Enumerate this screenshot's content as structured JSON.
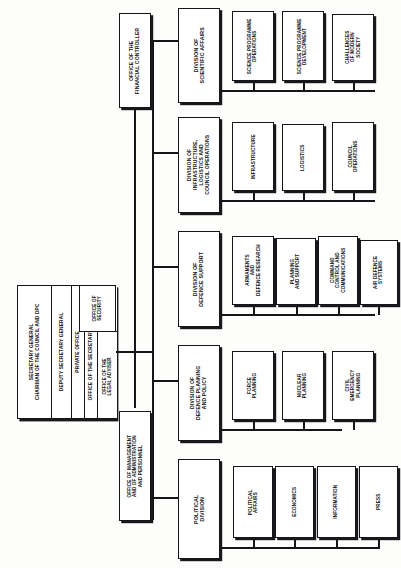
{
  "chart": {
    "type": "organization-chart",
    "orientation": "rotated-90-ccw",
    "top": {
      "label": "SECRETARY GENERAL\nCHAIRMAN OF THE COUNCIL AND DPC"
    },
    "executive_stack": [
      {
        "id": "secretary-general",
        "label": "SECRETARY GENERAL\nCHAIRMAN OF THE COUNCIL AND DPC"
      },
      {
        "id": "deputy-secretary-general",
        "label": "DEPUTY SECRETARY GENERAL"
      },
      {
        "id": "private-office",
        "label": "PRIVATE OFFICE"
      },
      {
        "id": "office-of-the-secretary-general",
        "label": "OFFICE OF THE SECRETARY GENERAL"
      },
      {
        "id": "executive-secretariat",
        "label": "EXECUTIVE\nSECRETARIAT"
      },
      {
        "id": "office-of-the-legal-adviser",
        "label": "OFFICE OF THE\nLEGAL ADVISER"
      },
      {
        "id": "office-of-security",
        "label": "OFFICE OF\nSECURITY"
      }
    ],
    "staff_offices": [
      {
        "id": "office-of-the-financial-controller",
        "label": "OFFICE OF THE\nFINANCIAL CONTROLLER"
      },
      {
        "id": "office-of-management-and-of-administration-and-personnel",
        "label": "OFFICE OF MANAGEMENT\nAND OF ADMINISTRATION\nAND PERSONNEL"
      }
    ],
    "divisions": [
      {
        "id": "division-of-scientific-affairs",
        "label": "DIVISION OF\nSCIENTIFIC AFFAIRS",
        "units": [
          {
            "id": "science-programme-operations",
            "label": "SCIENCE PROGRAMME\nOPERATIONS"
          },
          {
            "id": "science-programme-development",
            "label": "SCIENCE PROGRAMME\nDEVELOPMENT"
          },
          {
            "id": "challenges-of-modern-society",
            "label": "CHALLENGES\nOF MODERN\nSOCIETY"
          }
        ]
      },
      {
        "id": "division-of-infrastructure-logistics-and-council-operations",
        "label": "DIVISION OF\nINFRASTRUCTURE,\nLOGISTICS AND\nCOUNCIL OPERATIONS",
        "units": [
          {
            "id": "infrastructure",
            "label": "INFRASTRUCTURE"
          },
          {
            "id": "logistics",
            "label": "LOGISTICS"
          },
          {
            "id": "council-operations",
            "label": "COUNCIL\nOPERATIONS"
          }
        ]
      },
      {
        "id": "division-of-defence-support",
        "label": "DIVISION OF\nDEFENCE SUPPORT",
        "units": [
          {
            "id": "armaments-and-defence-research",
            "label": "ARMAMENTS\nAND\nDEFENCE RESEARCH"
          },
          {
            "id": "planning-and-support",
            "label": "PLANNING\nAND SUPPORT"
          },
          {
            "id": "command-control-and-communications",
            "label": "COMMAND\nCONTROL AND\nCOMMUNICATIONS"
          },
          {
            "id": "air-defence-systems",
            "label": "AIR DEFENCE\nSYSTEMS"
          }
        ]
      },
      {
        "id": "division-of-defence-planning-and-policy",
        "label": "DIVISION OF\nDEFENCE PLANNING\nAND POLICY",
        "units": [
          {
            "id": "force-planning",
            "label": "FORCE\nPLANNING"
          },
          {
            "id": "nuclear-planning",
            "label": "NUCLEAR\nPLANNING"
          },
          {
            "id": "civil-emergency-planning",
            "label": "CIVIL\nEMERGENCY\nPLANNING"
          }
        ]
      },
      {
        "id": "political-division",
        "label": "POLITICAL\nDIVISION",
        "units": [
          {
            "id": "political-affairs",
            "label": "POLITICAL\nAFFAIRS"
          },
          {
            "id": "economics",
            "label": "ECONOMICS"
          },
          {
            "id": "information",
            "label": "INFORMATION"
          },
          {
            "id": "press",
            "label": "PRESS"
          }
        ]
      }
    ]
  },
  "colors": {
    "ink": "#16161a",
    "paper": "#fdfdfc",
    "shadow": "#18181c"
  }
}
